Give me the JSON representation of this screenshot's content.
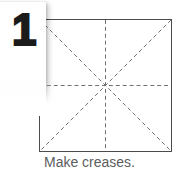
{
  "step": {
    "number": "1"
  },
  "caption": {
    "text": "Make creases."
  },
  "diagram": {
    "type": "origami-step",
    "shape": "square",
    "colors": {
      "background": "#ffffff",
      "paper_fill": "#ffffff",
      "paper_outline": "#4b4b4b",
      "crease_line": "#6e6e6e",
      "step_number": "#1b1b1b",
      "caption_text": "#5d5d5d"
    },
    "square": {
      "x": 39,
      "y": 19,
      "width": 133,
      "height": 133
    },
    "creases": [
      {
        "name": "vertical-crease",
        "x1": 66.5,
        "y1": 0,
        "x2": 66.5,
        "y2": 133,
        "style": "dashed"
      },
      {
        "name": "horizontal-crease",
        "x1": 0,
        "y1": 66.5,
        "x2": 133,
        "y2": 66.5,
        "style": "dashed"
      },
      {
        "name": "diagonal-crease-tl-br",
        "x1": 0,
        "y1": 0,
        "x2": 133,
        "y2": 133,
        "style": "dashed"
      },
      {
        "name": "diagonal-crease-tr-bl",
        "x1": 133,
        "y1": 0,
        "x2": 0,
        "y2": 133,
        "style": "dashed"
      }
    ]
  }
}
